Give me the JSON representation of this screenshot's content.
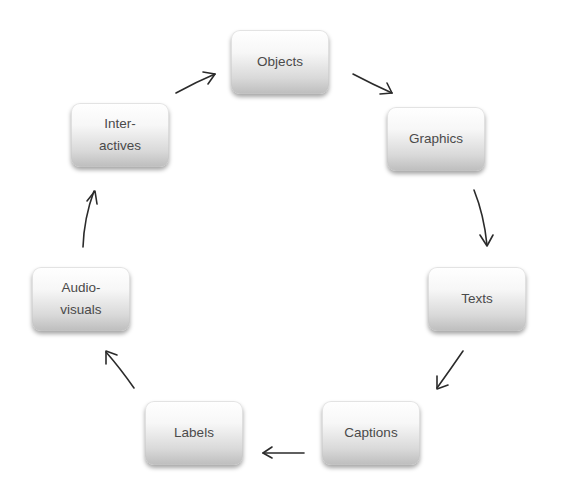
{
  "diagram": {
    "type": "cycle",
    "nodes": [
      {
        "id": "objects",
        "label": "Objects",
        "x": 231,
        "y": 30
      },
      {
        "id": "graphics",
        "label": "Graphics",
        "x": 387,
        "y": 107
      },
      {
        "id": "texts",
        "label": "Texts",
        "x": 428,
        "y": 267
      },
      {
        "id": "captions",
        "label": "Captions",
        "x": 322,
        "y": 401
      },
      {
        "id": "labels",
        "label": "Labels",
        "x": 145,
        "y": 401
      },
      {
        "id": "audio-visuals",
        "label": "Audio-\nvisuals",
        "x": 32,
        "y": 267
      },
      {
        "id": "inter-actives",
        "label": "Inter-\nactives",
        "x": 71,
        "y": 103
      }
    ],
    "edges": [
      {
        "from": "objects",
        "to": "graphics"
      },
      {
        "from": "graphics",
        "to": "texts"
      },
      {
        "from": "texts",
        "to": "captions"
      },
      {
        "from": "captions",
        "to": "labels"
      },
      {
        "from": "labels",
        "to": "audio-visuals"
      },
      {
        "from": "audio-visuals",
        "to": "inter-actives"
      },
      {
        "from": "inter-actives",
        "to": "objects"
      }
    ],
    "colors": {
      "node_top": "#ffffff",
      "node_bottom": "#bdbdbd",
      "text": "#4a4a4a",
      "arrow": "#2b2b2b"
    }
  }
}
